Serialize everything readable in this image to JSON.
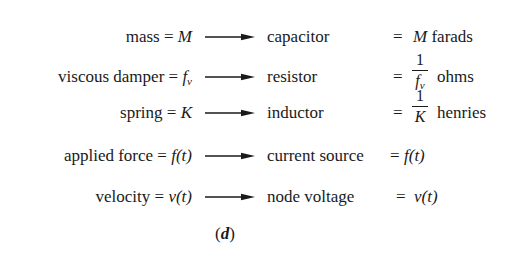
{
  "figure": {
    "caption_open": "(",
    "caption_letter": "d",
    "caption_close": ")",
    "rows": [
      {
        "mechanical_label": "mass = ",
        "mechanical_symbol": "M",
        "electrical_element": "capacitor",
        "equals": "=",
        "value_symbol": "M",
        "value_unit": " farads"
      },
      {
        "mechanical_label": "viscous damper = ",
        "mechanical_symbol": "f",
        "mechanical_subscript": "v",
        "electrical_element": "resistor",
        "equals": "=",
        "fraction_numerator": "1",
        "fraction_denominator": "f",
        "fraction_denominator_subscript": "v",
        "value_unit": "ohms"
      },
      {
        "mechanical_label": "spring = ",
        "mechanical_symbol": "K",
        "electrical_element": "inductor",
        "equals": "=",
        "fraction_numerator": "1",
        "fraction_denominator": "K",
        "value_unit": "henries"
      },
      {
        "mechanical_label": "applied force = ",
        "mechanical_symbol": "f(t)",
        "electrical_element": "current source",
        "equals": "=",
        "value_symbol": "f(t)"
      },
      {
        "mechanical_label": "velocity = ",
        "mechanical_symbol": "v(t)",
        "electrical_element": "node voltage",
        "equals": "=",
        "value_symbol": "v(t)"
      }
    ],
    "arrow_icon": "right-arrow-icon",
    "ink_color": "#1a1a1a",
    "background_color": "#ffffff"
  }
}
